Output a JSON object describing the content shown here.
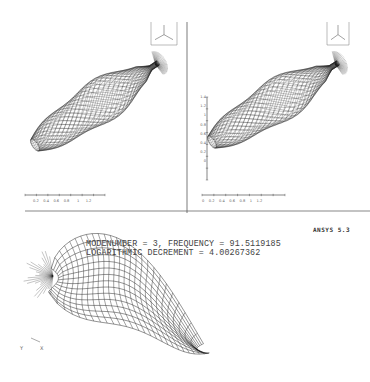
{
  "figure": {
    "software_label": "ANSYS 5.3",
    "mode_info": {
      "line1": "MODENUMBER = 3, FREQUENCY = 91.5119185",
      "line2": "LOGARITHMIC DECREMENT = 4.00267362",
      "mode_number": 3,
      "frequency": "91.5119185",
      "log_decrement": "4.00267362"
    },
    "panels": [
      {
        "id": "left-view",
        "triad_labels": [
          "x",
          "y",
          "z"
        ],
        "x_scale_ticks": [
          "0.2",
          "0.4",
          "0.6",
          "0.8",
          "1",
          "1.2"
        ],
        "x_scale_exp": "E"
      },
      {
        "id": "right-view",
        "triad_labels": [
          "x",
          "z"
        ],
        "x_scale_ticks": [
          "0",
          "0.2",
          "0.4",
          "0.6",
          "0.8",
          "1",
          "1.2"
        ],
        "x_scale_exp": "E",
        "y_scale_ticks": [
          "1.4",
          "1.2",
          "1",
          "0.8",
          "0.6",
          "0.4",
          "0.2",
          "0"
        ]
      },
      {
        "id": "bottom-deformed-view",
        "triad_labels": [
          "Y",
          "X"
        ]
      }
    ],
    "colors": {
      "background": "#ffffff",
      "mesh": "#1a1a1a",
      "frame": "#555555"
    }
  }
}
